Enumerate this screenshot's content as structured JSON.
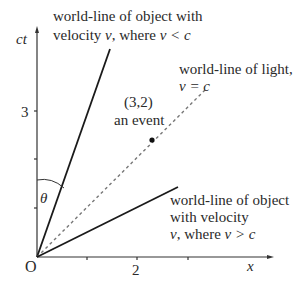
{
  "axes": {
    "y_label": "ct",
    "x_label": "x",
    "origin_label": "O",
    "y_tick_label": "3",
    "x_tick_label": "2"
  },
  "event": {
    "coords": "(3,2)",
    "label": "an event"
  },
  "angle_label": "θ",
  "worldlines": {
    "slow": {
      "line1": "world-line of  object with",
      "line2_prefix": "velocity ",
      "line2_v": "v",
      "line2_mid": ", where ",
      "line2_cond": "v < c"
    },
    "light": {
      "line1": "world-line of light,",
      "line2": "v = c"
    },
    "fast": {
      "line1": "world-line of  object",
      "line2": "with velocity",
      "line3_v": "v",
      "line3_mid": ", where ",
      "line3_cond": "v > c"
    }
  },
  "colors": {
    "line": "#1a1a1a",
    "dashed": "#777777",
    "text": "#2a2a2a"
  }
}
